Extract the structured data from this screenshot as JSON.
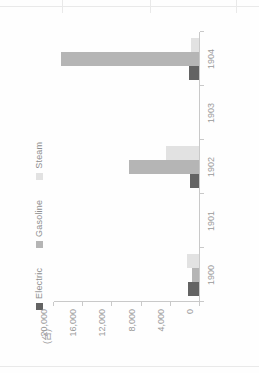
{
  "page": {
    "background": "#ffffff",
    "rotation_degrees": -90
  },
  "axis_label": {
    "unit": "(台)"
  },
  "legend": {
    "position": "top-left",
    "items": [
      {
        "label": "Electric",
        "color": "#636363"
      },
      {
        "label": "Gasoline",
        "color": "#b5b5b5"
      },
      {
        "label": "Steam",
        "color": "#e2e2e2"
      }
    ]
  },
  "chart_data": {
    "type": "bar",
    "title": "",
    "subtitle": "",
    "xlabel": "",
    "ylabel": "(台)",
    "categories": [
      "1900",
      "1901",
      "1902",
      "1903",
      "1904"
    ],
    "series": [
      {
        "name": "Electric",
        "color": "#636363",
        "values": [
          1575,
          0,
          1200,
          0,
          1425
        ]
      },
      {
        "name": "Gasoline",
        "color": "#b5b5b5",
        "values": [
          936,
          0,
          9700,
          0,
          19000
        ]
      },
      {
        "name": "Steam",
        "color": "#e2e2e2",
        "values": [
          1681,
          0,
          4500,
          0,
          1100
        ]
      }
    ],
    "ylim": [
      0,
      20000
    ],
    "yticks": [
      0,
      4000,
      8000,
      12000,
      16000,
      20000
    ],
    "ytick_labels": [
      "0",
      "4,000",
      "8,000",
      "12,000",
      "16,000",
      "20,000"
    ],
    "grid": false,
    "legend_position": "top-left",
    "orientation": "vertical-rotated"
  }
}
